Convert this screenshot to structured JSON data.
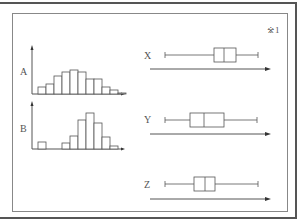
{
  "figure": {
    "note": "※1",
    "histograms": [
      {
        "label": "A",
        "bins": [
          7,
          10,
          18,
          22,
          24,
          22,
          15,
          15,
          7,
          4,
          1
        ]
      },
      {
        "label": "B",
        "bins": [
          7,
          0,
          0,
          6,
          13,
          29,
          36,
          26,
          12,
          3
        ]
      }
    ],
    "boxplots": [
      {
        "label": "X",
        "min": 165,
        "q1": 214,
        "median": 224,
        "q3": 236,
        "max": 258
      },
      {
        "label": "Y",
        "min": 165,
        "q1": 190,
        "median": 204,
        "q3": 224,
        "max": 257
      },
      {
        "label": "Z",
        "min": 165,
        "q1": 194,
        "median": 205,
        "q3": 215,
        "max": 258
      }
    ]
  },
  "chart_data": [
    {
      "type": "bar",
      "title": "A",
      "categories": [
        "1",
        "2",
        "3",
        "4",
        "5",
        "6",
        "7",
        "8",
        "9",
        "10",
        "11"
      ],
      "values": [
        7,
        10,
        18,
        22,
        24,
        22,
        15,
        15,
        7,
        4,
        1
      ],
      "xlabel": "",
      "ylabel": ""
    },
    {
      "type": "bar",
      "title": "B",
      "categories": [
        "1",
        "2",
        "3",
        "4",
        "5",
        "6",
        "7",
        "8",
        "9",
        "10"
      ],
      "values": [
        7,
        0,
        0,
        6,
        13,
        29,
        36,
        26,
        12,
        3
      ],
      "xlabel": "",
      "ylabel": ""
    },
    {
      "type": "boxplot",
      "title": "X/Y/Z",
      "series": [
        {
          "name": "X",
          "values": [
            165,
            214,
            224,
            236,
            258
          ]
        },
        {
          "name": "Y",
          "values": [
            165,
            190,
            204,
            224,
            257
          ]
        },
        {
          "name": "Z",
          "values": [
            165,
            194,
            205,
            215,
            258
          ]
        }
      ]
    }
  ]
}
